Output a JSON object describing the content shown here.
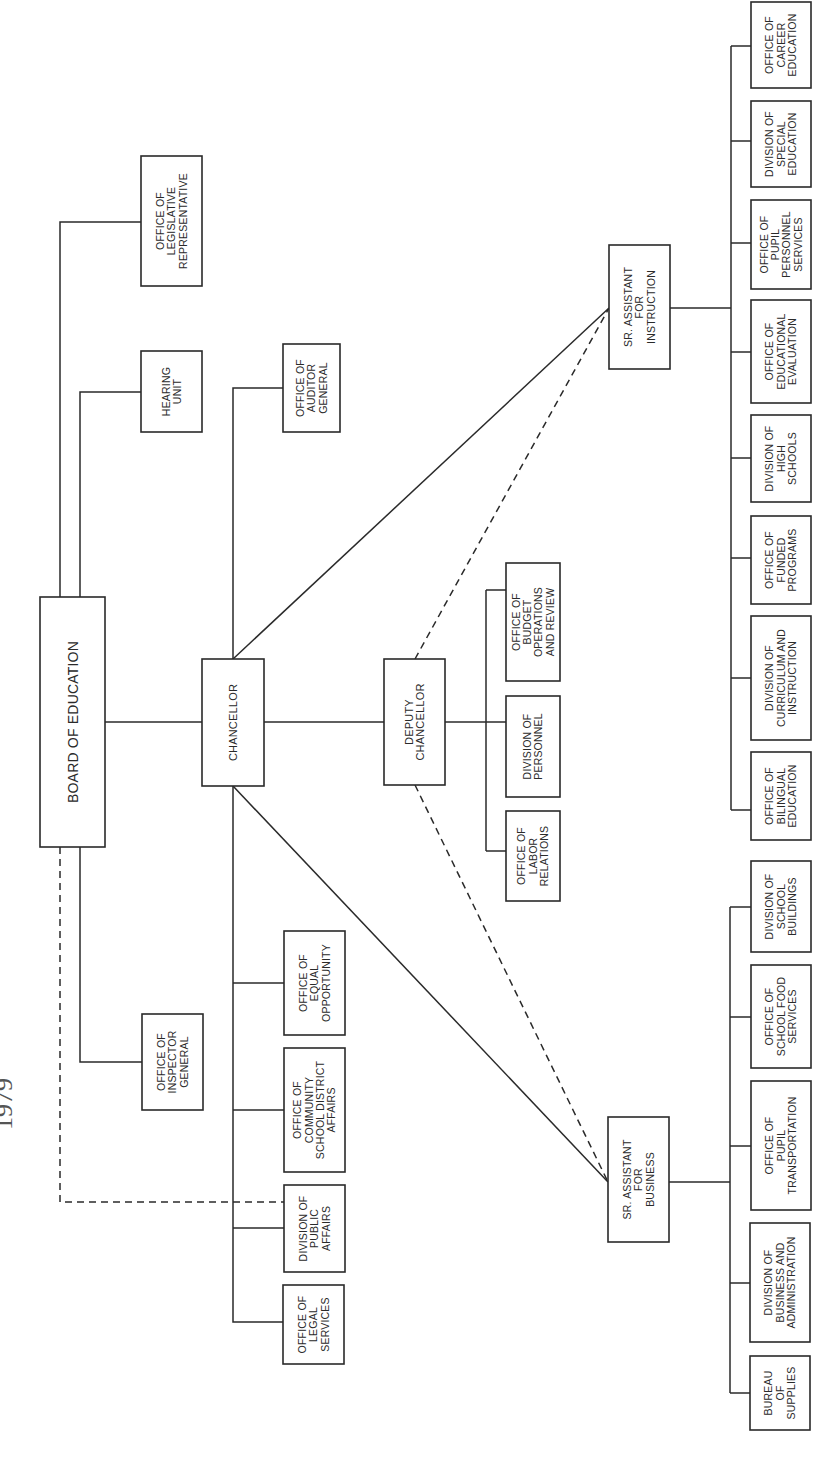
{
  "title_fragment": "1979",
  "boxes": [
    {
      "id": "board-of-education",
      "x": 40,
      "y": 597,
      "w": 65,
      "h": 250,
      "size": "big",
      "lines": [
        "BOARD OF EDUCATION"
      ]
    },
    {
      "id": "office-of-legislative-representative",
      "x": 141,
      "y": 156,
      "w": 61,
      "h": 130,
      "lines": [
        "OFFICE OF",
        "LEGISLATIVE",
        "REPRESENTATIVE"
      ]
    },
    {
      "id": "hearing-unit",
      "x": 141,
      "y": 351,
      "w": 61,
      "h": 81,
      "lines": [
        "HEARING",
        "UNIT"
      ]
    },
    {
      "id": "office-of-inspector-general",
      "x": 142,
      "y": 1014,
      "w": 61,
      "h": 96,
      "lines": [
        "OFFICE OF",
        "INSPECTOR",
        "GENERAL"
      ]
    },
    {
      "id": "chancellor",
      "x": 202,
      "y": 659,
      "w": 62,
      "h": 127,
      "size": "mid",
      "lines": [
        "CHANCELLOR"
      ]
    },
    {
      "id": "office-of-auditor-general",
      "x": 283,
      "y": 344,
      "w": 57,
      "h": 88,
      "lines": [
        "OFFICE OF",
        "AUDITOR",
        "GENERAL"
      ]
    },
    {
      "id": "office-of-equal-opportunity",
      "x": 284,
      "y": 931,
      "w": 61,
      "h": 104,
      "lines": [
        "OFFICE OF",
        "EQUAL",
        "OPPORTUNITY"
      ]
    },
    {
      "id": "office-of-community-school-district-affairs",
      "x": 284,
      "y": 1048,
      "w": 61,
      "h": 124,
      "lines": [
        "OFFICE OF",
        "COMMUNITY",
        "SCHOOL DISTRICT",
        "AFFAIRS"
      ]
    },
    {
      "id": "division-of-public-affairs",
      "x": 284,
      "y": 1185,
      "w": 61,
      "h": 87,
      "lines": [
        "DIVISION OF",
        "PUBLIC",
        "AFFAIRS"
      ]
    },
    {
      "id": "office-of-legal-services",
      "x": 283,
      "y": 1285,
      "w": 61,
      "h": 79,
      "lines": [
        "OFFICE OF",
        "LEGAL",
        "SERVICES"
      ]
    },
    {
      "id": "deputy-chancellor",
      "x": 384,
      "y": 659,
      "w": 61,
      "h": 126,
      "size": "mid",
      "lines": [
        "DEPUTY",
        "CHANCELLOR"
      ]
    },
    {
      "id": "office-of-budget-operations-and-review",
      "x": 506,
      "y": 563,
      "w": 54,
      "h": 118,
      "lines": [
        "OFFICE OF",
        "BUDGET",
        "OPERATIONS",
        "AND REVIEW"
      ]
    },
    {
      "id": "division-of-personnel",
      "x": 506,
      "y": 696,
      "w": 54,
      "h": 101,
      "lines": [
        "DIVISION OF",
        "PERSONNEL"
      ]
    },
    {
      "id": "office-of-labor-relations",
      "x": 506,
      "y": 811,
      "w": 54,
      "h": 90,
      "lines": [
        "OFFICE OF",
        "LABOR",
        "RELATIONS"
      ]
    },
    {
      "id": "sr-assistant-for-instruction",
      "x": 609,
      "y": 245,
      "w": 61,
      "h": 124,
      "lines": [
        "SR. ASSISTANT",
        "FOR",
        "INSTRUCTION"
      ]
    },
    {
      "id": "sr-assistant-for-business",
      "x": 608,
      "y": 1117,
      "w": 61,
      "h": 125,
      "lines": [
        "SR. ASSISTANT",
        "FOR",
        "BUSINESS"
      ]
    },
    {
      "id": "office-of-career-education",
      "x": 751,
      "y": 2,
      "w": 60,
      "h": 86,
      "lines": [
        "OFFICE OF",
        "CAREER",
        "EDUCATION"
      ]
    },
    {
      "id": "division-of-special-education",
      "x": 751,
      "y": 101,
      "w": 60,
      "h": 86,
      "lines": [
        "DIVISION OF",
        "SPECIAL",
        "EDUCATION"
      ]
    },
    {
      "id": "office-of-pupil-personnel-services",
      "x": 751,
      "y": 200,
      "w": 60,
      "h": 89,
      "lines": [
        "OFFICE OF",
        "PUPIL",
        "PERSONNEL",
        "SERVICES"
      ]
    },
    {
      "id": "office-of-educational-evaluation",
      "x": 751,
      "y": 300,
      "w": 60,
      "h": 103,
      "lines": [
        "OFFICE OF",
        "EDUCATIONAL",
        "EVALUATION"
      ]
    },
    {
      "id": "division-of-high-schools",
      "x": 751,
      "y": 415,
      "w": 60,
      "h": 87,
      "lines": [
        "DIVISION OF",
        "HIGH",
        "SCHOOLS"
      ]
    },
    {
      "id": "office-of-funded-programs",
      "x": 751,
      "y": 516,
      "w": 60,
      "h": 88,
      "lines": [
        "OFFICE OF",
        "FUNDED",
        "PROGRAMS"
      ]
    },
    {
      "id": "division-of-curriculum-and-instruction",
      "x": 751,
      "y": 616,
      "w": 60,
      "h": 124,
      "lines": [
        "DIVISION OF",
        "CURRICULUM AND",
        "INSTRUCTION"
      ]
    },
    {
      "id": "office-of-bilingual-education",
      "x": 751,
      "y": 752,
      "w": 60,
      "h": 88,
      "lines": [
        "OFFICE OF",
        "BILINGUAL",
        "EDUCATION"
      ]
    },
    {
      "id": "division-of-school-buildings",
      "x": 751,
      "y": 861,
      "w": 60,
      "h": 91,
      "lines": [
        "DIVISION OF",
        "SCHOOL",
        "BUILDINGS"
      ]
    },
    {
      "id": "office-of-school-food-services",
      "x": 751,
      "y": 965,
      "w": 60,
      "h": 103,
      "lines": [
        "OFFICE OF",
        "SCHOOL FOOD",
        "SERVICES"
      ]
    },
    {
      "id": "office-of-pupil-transportation",
      "x": 751,
      "y": 1081,
      "w": 60,
      "h": 129,
      "lines": [
        "OFFICE OF",
        "PUPIL",
        "TRANSPORTATION"
      ]
    },
    {
      "id": "division-of-business-and-administration",
      "x": 750,
      "y": 1223,
      "w": 60,
      "h": 119,
      "lines": [
        "DIVISION OF",
        "BUSINESS AND",
        "ADMINISTRATION"
      ]
    },
    {
      "id": "bureau-of-supplies",
      "x": 750,
      "y": 1356,
      "w": 60,
      "h": 74,
      "lines": [
        "BUREAU",
        "OF",
        "SUPPLIES"
      ]
    }
  ],
  "solid_lines": [
    "M60 597 V222 H141",
    "M80 597 V392 H141",
    "M80 847 V1062 H142",
    "M105 722 H202",
    "M233 659 V388 H283",
    "M264 722 H384",
    "M233 786 V1322 H283",
    "M233 983 H284",
    "M233 1110 H284",
    "M233 1228 H284",
    "M233 659 L609 308",
    "M233 786 L608 1182",
    "M445 722 H486",
    "M486 590 V851",
    "M486 590 H506",
    "M486 722 H506",
    "M486 851 H506",
    "M670 308 H731",
    "M731 46 V810",
    "M731 46 H751",
    "M731 141 H751",
    "M731 243 H751",
    "M731 352 H751",
    "M731 458 H751",
    "M731 558 H751",
    "M731 678 H751",
    "M731 810 H751",
    "M669 1182 H730",
    "M730 907 V1393",
    "M730 907 H751",
    "M730 1017 H751",
    "M730 1146 H751",
    "M730 1283 H750",
    "M730 1393 H750"
  ],
  "dashed_lines": [
    "M60 847 V1202 H284",
    "M415 659 L609 308",
    "M415 785 L608 1182"
  ]
}
